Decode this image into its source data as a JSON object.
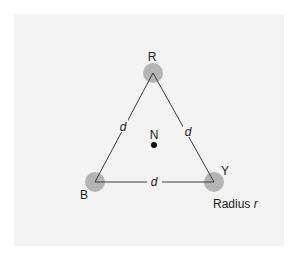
{
  "diagram": {
    "type": "equilateral-triangle",
    "vertices": [
      {
        "id": "R",
        "label": "R",
        "cx": 153,
        "cy": 73
      },
      {
        "id": "B",
        "label": "B",
        "cx": 95,
        "cy": 182
      },
      {
        "id": "Y",
        "label": "Y",
        "cx": 214,
        "cy": 182
      }
    ],
    "edge_label": "d",
    "edges": [
      {
        "from": "R",
        "to": "B",
        "label": "d"
      },
      {
        "from": "R",
        "to": "Y",
        "label": "d"
      },
      {
        "from": "B",
        "to": "Y",
        "label": "d"
      }
    ],
    "center": {
      "label": "N"
    },
    "radius_caption": {
      "prefix": "Radius ",
      "symbol": "r"
    },
    "colors": {
      "circle": "#b4b4b4",
      "line": "#3a3a3a",
      "background": "#f3f3f3"
    }
  }
}
